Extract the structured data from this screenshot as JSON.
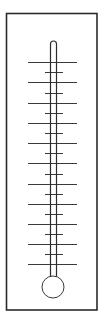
{
  "diagram": {
    "title": "",
    "type": "thermometer",
    "colors": {
      "background": "#ffffff",
      "frame_stroke": "#2b2b2b",
      "tube_stroke": "#2b2b2b",
      "tick_stroke": "#3a3a3a",
      "bulb_stroke": "#3a3a3a",
      "bulb_fill": "#ffffff"
    },
    "frame": {
      "x": 6.5,
      "y": 13.5,
      "width": 90.5,
      "height": 296.5,
      "stroke_width": 1.6
    },
    "tube": {
      "left_x": 50.5,
      "right_x": 56.5,
      "top_y": 41,
      "bottom_y": 277,
      "stroke_width": 1.2
    },
    "bulb": {
      "cx": 53,
      "cy": 287,
      "r": 11,
      "stroke_width": 1
    },
    "ticks": {
      "major": {
        "x1": 28,
        "x2": 77,
        "y": [
          62,
          82,
          103,
          123,
          143,
          163,
          184,
          204,
          224,
          244,
          264
        ]
      },
      "minor": {
        "x1": 45,
        "x2": 63,
        "y": [
          72,
          93,
          113,
          133,
          153,
          174,
          194,
          214,
          234,
          254
        ]
      },
      "stroke_width": 1
    },
    "labels": []
  }
}
